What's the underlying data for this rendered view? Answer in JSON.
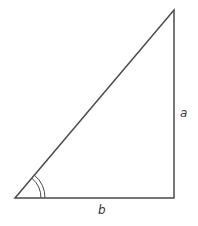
{
  "diagram": {
    "type": "right-triangle",
    "labels": {
      "vertical_side": "a",
      "horizontal_side": "b"
    },
    "vertices": {
      "bottom_left": [
        15,
        198
      ],
      "bottom_right": [
        174,
        198
      ],
      "top_right": [
        174,
        10
      ]
    },
    "angle_marker": "double-arc at bottom-left vertex",
    "stroke_color": "#4a4a4a"
  }
}
